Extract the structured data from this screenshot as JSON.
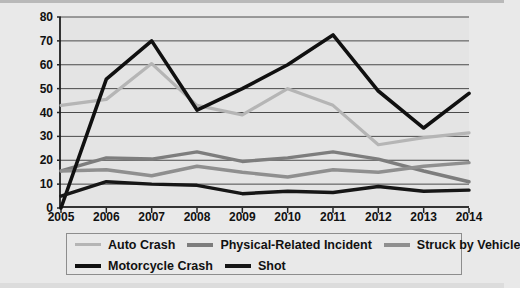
{
  "chart_data": {
    "type": "line",
    "title": "",
    "xlabel": "",
    "ylabel": "Number of Deaths",
    "categories": [
      "2005",
      "2006",
      "2007",
      "2008",
      "2009",
      "2010",
      "2011",
      "2012",
      "2013",
      "2014"
    ],
    "x": [
      2005,
      2006,
      2007,
      2008,
      2009,
      2010,
      2011,
      2012,
      2013,
      2014
    ],
    "ylim": [
      0,
      80
    ],
    "xlim": [
      2005,
      2014
    ],
    "yticks": [
      0,
      10,
      20,
      30,
      40,
      50,
      60,
      70,
      80
    ],
    "grid": true,
    "legend_position": "bottom",
    "series": [
      {
        "name": "Auto Crash",
        "color": "#b5b5b5",
        "values": [
          43,
          45.5,
          60.5,
          43,
          39,
          50,
          43,
          26.5,
          29.5,
          31.5
        ]
      },
      {
        "name": "Physical-Related Incident",
        "color": "#7d7d7d",
        "values": [
          15.5,
          21,
          20.5,
          23.5,
          19.5,
          21,
          23.5,
          20.5,
          15.5,
          11
        ]
      },
      {
        "name": "Struck by Vehicle",
        "color": "#8f8f8f",
        "values": [
          15.5,
          16,
          13.5,
          17.5,
          15,
          13,
          16,
          15,
          17.5,
          19
        ]
      },
      {
        "name": "Motorcycle Crash",
        "color": "#101010",
        "values": [
          0,
          54,
          70,
          41,
          50,
          60,
          72.5,
          49,
          33.5,
          48
        ]
      },
      {
        "name": "Shot",
        "color": "#161616",
        "values": [
          5,
          11,
          10,
          9.5,
          6,
          7,
          6.5,
          9,
          7,
          7.5
        ]
      }
    ]
  },
  "axis": {
    "y_tick_labels": [
      "80",
      "70",
      "60",
      "50",
      "40",
      "30",
      "20",
      "10",
      "0"
    ],
    "x_tick_labels": [
      "2005",
      "2006",
      "2007",
      "2008",
      "2009",
      "2010",
      "2011",
      "2012",
      "2013",
      "2014"
    ],
    "y_axis_title": "Number of Deaths"
  },
  "legend": {
    "rows": [
      [
        {
          "label": "Auto Crash",
          "color": "#b5b5b5",
          "width": 3
        },
        {
          "label": "Physical-Related Incident",
          "color": "#7d7d7d",
          "width": 4
        },
        {
          "label": "Struck by Vehicle",
          "color": "#8f8f8f",
          "width": 4
        }
      ],
      [
        {
          "label": "Motorcycle Crash",
          "color": "#101010",
          "width": 4
        },
        {
          "label": "Shot",
          "color": "#161616",
          "width": 4
        }
      ]
    ]
  }
}
